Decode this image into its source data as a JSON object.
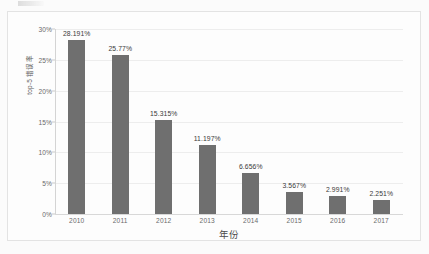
{
  "chart_data": {
    "type": "bar",
    "title": "",
    "xlabel": "年份",
    "ylabel": "top-5 错误率",
    "categories": [
      "2010",
      "2011",
      "2012",
      "2013",
      "2014",
      "2015",
      "2016",
      "2017"
    ],
    "values": [
      28.191,
      25.77,
      15.315,
      11.197,
      6.656,
      3.567,
      2.991,
      2.251
    ],
    "value_labels": [
      "28.191%",
      "25.77%",
      "15.315%",
      "11.197%",
      "6.656%",
      "3.567%",
      "2.991%",
      "2.251%"
    ],
    "ylim": [
      0,
      30
    ],
    "ytick_values": [
      0,
      5,
      10,
      15,
      20,
      25,
      30
    ],
    "ytick_labels": [
      "0%",
      "5%",
      "10%",
      "15%",
      "20%",
      "25%",
      "30%"
    ],
    "grid": true,
    "legend": "none",
    "bar_color": "#6f6f6f",
    "gridline_color": "#ededed",
    "background_color": "#fdfdfd",
    "text_color": "#6a6a6a"
  }
}
